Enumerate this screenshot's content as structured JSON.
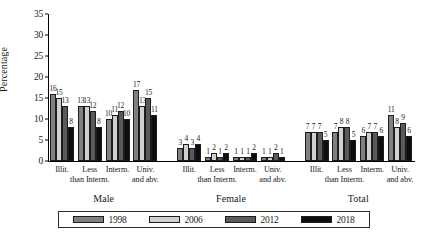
{
  "chart_data": {
    "type": "bar",
    "title": "",
    "xlabel": "",
    "ylabel": "Percentage",
    "ylim": [
      0,
      35
    ],
    "yticks": [
      0,
      5,
      10,
      15,
      20,
      25,
      30,
      35
    ],
    "grid": false,
    "legend_position": "bottom",
    "categories": [
      "Illit.",
      "Less than Interm.",
      "Interm.",
      "Univ. and abv.",
      "Illit.",
      "Less than Interm.",
      "Interm.",
      "Univ. and abv.",
      "Illit.",
      "Less than Interm.",
      "Interm.",
      "Univ. and abv."
    ],
    "category_lines": [
      [
        "Illit."
      ],
      [
        "Less",
        "than Interm."
      ],
      [
        "Interm."
      ],
      [
        "Univ.",
        "and abv."
      ],
      [
        "Illit."
      ],
      [
        "Less",
        "than Interm."
      ],
      [
        "Interm."
      ],
      [
        "Univ.",
        "and abv."
      ],
      [
        "Illit."
      ],
      [
        "Less",
        "than Interm."
      ],
      [
        "Interm."
      ],
      [
        "Univ.",
        "and abv."
      ]
    ],
    "groups": [
      "Male",
      "Female",
      "Total"
    ],
    "group_spans": [
      4,
      4,
      4
    ],
    "series": [
      {
        "name": "1998",
        "color": "#808080",
        "values": [
          16,
          13,
          10,
          17,
          3,
          1,
          1,
          1,
          7,
          7,
          6,
          11
        ]
      },
      {
        "name": "2006",
        "color": "#d0d0d0",
        "values": [
          15,
          13,
          11,
          13,
          4,
          2,
          1,
          1,
          7,
          8,
          7,
          8
        ]
      },
      {
        "name": "2012",
        "color": "#5a5a5a",
        "values": [
          13,
          12,
          12,
          15,
          3,
          1,
          1,
          2,
          7,
          8,
          7,
          9
        ]
      },
      {
        "name": "2018",
        "color": "#0d0d0d",
        "values": [
          8,
          8,
          10,
          11,
          4,
          2,
          2,
          1,
          5,
          5,
          6,
          6
        ]
      }
    ]
  }
}
